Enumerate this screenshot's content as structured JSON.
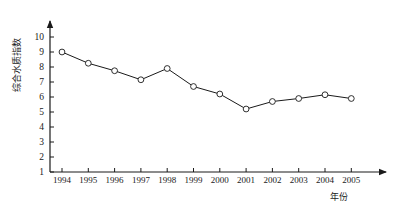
{
  "chart_data": {
    "type": "line",
    "title": "",
    "xlabel": "年份",
    "ylabel": "综合水质指数",
    "categories": [
      "1994",
      "1995",
      "1996",
      "1997",
      "1998",
      "1999",
      "2000",
      "2001",
      "2002",
      "2003",
      "2004",
      "2005"
    ],
    "values": [
      9.0,
      8.25,
      7.75,
      7.15,
      7.9,
      6.7,
      6.2,
      5.2,
      5.7,
      5.9,
      6.15,
      5.9
    ],
    "series": [
      {
        "name": "综合水质指数",
        "values": [
          9.0,
          8.25,
          7.75,
          7.15,
          7.9,
          6.7,
          6.2,
          5.2,
          5.7,
          5.9,
          6.15,
          5.9
        ]
      }
    ],
    "ylim": [
      1,
      10
    ],
    "yticks": [
      1,
      2,
      3,
      4,
      5,
      6,
      7,
      8,
      9,
      10
    ],
    "ytick_labels": [
      "1",
      "2",
      "3",
      "4",
      "5",
      "6",
      "7",
      "8",
      "9",
      "10"
    ],
    "xlim_categories": 12,
    "grid": false,
    "legend": "none",
    "marker": "open-circle",
    "line_color": "#1a1a1a",
    "marker_color": "#1a1a1a",
    "axis_color": "#1a1a1a",
    "background": "#ffffff",
    "axis_arrows": true
  },
  "axis": {
    "y_title": "综合水质指数",
    "x_title": "年份"
  }
}
